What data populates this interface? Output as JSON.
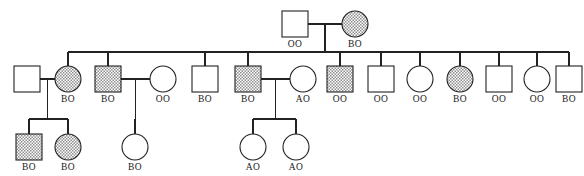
{
  "chart_data": {
    "type": "diagram",
    "title": "",
    "subtype": "pedigree-chart",
    "legend": {
      "shaded": "affected individual",
      "open": "unaffected individual",
      "square": "male",
      "circle": "female"
    },
    "generations": [
      {
        "id": "I",
        "y": 24,
        "individuals": [
          {
            "id": "I-1",
            "shape": "square",
            "fill": "open",
            "genotype": "OO",
            "x": 295
          },
          {
            "id": "I-2",
            "shape": "circle",
            "fill": "shaded",
            "genotype": "BO",
            "x": 355
          }
        ]
      },
      {
        "id": "II",
        "y": 79,
        "individuals": [
          {
            "id": "II-s1",
            "shape": "square",
            "fill": "open",
            "genotype": "",
            "x": 27,
            "role": "spouse"
          },
          {
            "id": "II-1",
            "shape": "circle",
            "fill": "shaded",
            "genotype": "BO",
            "x": 68,
            "role": "child"
          },
          {
            "id": "II-2",
            "shape": "square",
            "fill": "shaded",
            "genotype": "BO",
            "x": 108,
            "role": "child"
          },
          {
            "id": "II-s2",
            "shape": "circle",
            "fill": "open",
            "genotype": "OO",
            "x": 163,
            "role": "spouse"
          },
          {
            "id": "II-3",
            "shape": "square",
            "fill": "open",
            "genotype": "BO",
            "x": 205,
            "role": "child"
          },
          {
            "id": "II-4",
            "shape": "square",
            "fill": "shaded",
            "genotype": "BO",
            "x": 248,
            "role": "child"
          },
          {
            "id": "II-s3",
            "shape": "circle",
            "fill": "open",
            "genotype": "AO",
            "x": 303,
            "role": "spouse"
          },
          {
            "id": "II-5",
            "shape": "square",
            "fill": "shaded",
            "genotype": "OO",
            "x": 340,
            "role": "child"
          },
          {
            "id": "II-6",
            "shape": "square",
            "fill": "open",
            "genotype": "OO",
            "x": 381,
            "role": "child"
          },
          {
            "id": "II-7",
            "shape": "circle",
            "fill": "open",
            "genotype": "OO",
            "x": 420,
            "role": "child"
          },
          {
            "id": "II-8",
            "shape": "circle",
            "fill": "shaded",
            "genotype": "BO",
            "x": 460,
            "role": "child"
          },
          {
            "id": "II-9",
            "shape": "square",
            "fill": "open",
            "genotype": "OO",
            "x": 499,
            "role": "child"
          },
          {
            "id": "II-10",
            "shape": "circle",
            "fill": "open",
            "genotype": "OO",
            "x": 537,
            "role": "child"
          },
          {
            "id": "II-11",
            "shape": "square",
            "fill": "open",
            "genotype": "BO",
            "x": 569,
            "role": "child"
          }
        ]
      },
      {
        "id": "III",
        "y": 147,
        "individuals": [
          {
            "id": "III-1",
            "shape": "square",
            "fill": "shaded",
            "genotype": "BO",
            "x": 29
          },
          {
            "id": "III-2",
            "shape": "circle",
            "fill": "shaded",
            "genotype": "BO",
            "x": 68
          },
          {
            "id": "III-3",
            "shape": "circle",
            "fill": "open",
            "genotype": "BO",
            "x": 135
          },
          {
            "id": "III-4",
            "shape": "circle",
            "fill": "open",
            "genotype": "AO",
            "x": 253
          },
          {
            "id": "III-5",
            "shape": "circle",
            "fill": "open",
            "genotype": "AO",
            "x": 296
          }
        ]
      }
    ],
    "matings": [
      {
        "left": "I-1",
        "right": "I-2",
        "children": [
          "II-1",
          "II-2",
          "II-3",
          "II-4",
          "II-5",
          "II-6",
          "II-7",
          "II-8",
          "II-9",
          "II-10",
          "II-11"
        ]
      },
      {
        "left": "II-s1",
        "right": "II-1",
        "children": [
          "III-1",
          "III-2"
        ]
      },
      {
        "left": "II-2",
        "right": "II-s2",
        "children": [
          "III-3"
        ]
      },
      {
        "left": "II-4",
        "right": "II-s3",
        "children": [
          "III-4",
          "III-5"
        ]
      }
    ],
    "genotype_labels": [
      "OO",
      "BO",
      "AO"
    ]
  },
  "geometry": {
    "square_size": 26,
    "circle_radius": 13,
    "stroke": "#222222",
    "shaded_color": "#9a9a9a",
    "open_color": "#ffffff"
  }
}
